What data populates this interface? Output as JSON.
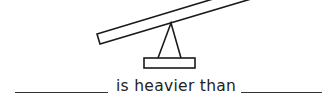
{
  "worksheet": {
    "illustration": "seesaw-icon",
    "sentence": "is heavier than",
    "blank_left": "",
    "blank_right": ""
  },
  "colors": {
    "stroke": "#1a1a1a",
    "background": "#ffffff"
  }
}
